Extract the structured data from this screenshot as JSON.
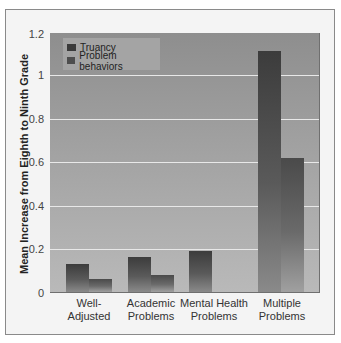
{
  "chart_data": {
    "type": "bar",
    "title": "",
    "xlabel": "",
    "ylabel": "Mean Increase from Eighth to Ninth Grade",
    "ylim": [
      0,
      1.2
    ],
    "yticks": [
      "0",
      "0.2",
      "0.4",
      "0.6",
      "0.8",
      "1",
      "1.2"
    ],
    "grid": true,
    "legend_position": "top-left",
    "categories": [
      "Well-Adjusted",
      "Academic Problems",
      "Mental Health Problems",
      "Multiple Problems"
    ],
    "category_labels": [
      [
        "Well-",
        "Adjusted"
      ],
      [
        "Academic",
        "Problems"
      ],
      [
        "Mental Health",
        "Problems"
      ],
      [
        "Multiple",
        "Problems"
      ]
    ],
    "series": [
      {
        "name": "Truancy",
        "values": [
          0.13,
          0.16,
          0.19,
          1.11
        ]
      },
      {
        "name": "Problem behaviors",
        "values": [
          0.06,
          0.08,
          0,
          0.62
        ]
      }
    ]
  },
  "colors": {
    "truancy": "#3a3a3a",
    "problem_behaviors": "#4e4e4e",
    "plot_background": "#a0a0a0"
  }
}
